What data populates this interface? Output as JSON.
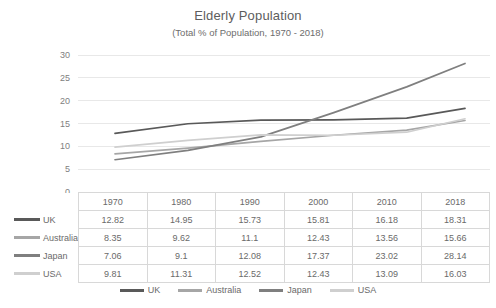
{
  "chart_data": {
    "type": "line",
    "title": "Elderly Population",
    "subtitle": "(Total % of Population, 1970 - 2018)",
    "xlabel": "",
    "ylabel": "",
    "categories": [
      "1970",
      "1980",
      "1990",
      "2000",
      "2010",
      "2018"
    ],
    "x_positions": [
      1970,
      1980,
      1990,
      2000,
      2010,
      2018
    ],
    "ylim": [
      0,
      30
    ],
    "y_ticks": [
      "0",
      "5",
      "10",
      "15",
      "20",
      "25",
      "30"
    ],
    "grid": "horizontal",
    "legend_position": "bottom",
    "series": [
      {
        "name": "UK",
        "color": "#595959",
        "values": [
          12.82,
          14.95,
          15.73,
          15.81,
          16.18,
          18.31
        ]
      },
      {
        "name": "Australia",
        "color": "#a6a6a6",
        "values": [
          8.35,
          9.62,
          11.1,
          12.43,
          13.56,
          15.66
        ]
      },
      {
        "name": "Japan",
        "color": "#7f7f7f",
        "values": [
          7.06,
          9.1,
          12.08,
          17.37,
          23.02,
          28.14
        ]
      },
      {
        "name": "USA",
        "color": "#cfcfcf",
        "values": [
          9.81,
          11.31,
          12.52,
          12.43,
          13.09,
          16.03
        ]
      }
    ]
  },
  "table": {
    "corner_label": "",
    "headers": [
      "1970",
      "1980",
      "1990",
      "2000",
      "2010",
      "2018"
    ],
    "rows": [
      {
        "label": "UK",
        "color": "#595959",
        "cells": [
          "12.82",
          "14.95",
          "15.73",
          "15.81",
          "16.18",
          "18.31"
        ]
      },
      {
        "label": "Australia",
        "color": "#a6a6a6",
        "cells": [
          "8.35",
          "9.62",
          "11.1",
          "12.43",
          "13.56",
          "15.66"
        ]
      },
      {
        "label": "Japan",
        "color": "#7f7f7f",
        "cells": [
          "7.06",
          "9.1",
          "12.08",
          "17.37",
          "23.02",
          "28.14"
        ]
      },
      {
        "label": "USA",
        "color": "#cfcfcf",
        "cells": [
          "9.81",
          "11.31",
          "12.52",
          "12.43",
          "13.09",
          "16.03"
        ]
      }
    ]
  },
  "legend": {
    "items": [
      {
        "label": "UK",
        "color": "#595959"
      },
      {
        "label": "Australia",
        "color": "#a6a6a6"
      },
      {
        "label": "Japan",
        "color": "#7f7f7f"
      },
      {
        "label": "USA",
        "color": "#cfcfcf"
      }
    ]
  },
  "colors": {
    "grid": "#e8e8e8",
    "text": "#6a6a6a",
    "background": "#ffffff",
    "table_border": "#d8d8d8"
  }
}
